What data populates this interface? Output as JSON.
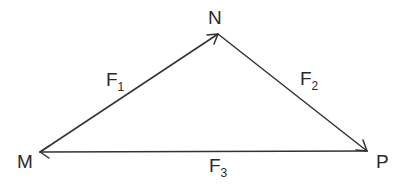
{
  "diagram": {
    "type": "vector-triangle",
    "stroke_color": "#333333",
    "points": [
      {
        "id": "M",
        "label": "M",
        "x": 40,
        "y": 152
      },
      {
        "id": "N",
        "label": "N",
        "x": 218,
        "y": 34
      },
      {
        "id": "P",
        "label": "P",
        "x": 367,
        "y": 151
      }
    ],
    "vectors": [
      {
        "id": "F1",
        "base": "F",
        "sub": "1",
        "from": "M",
        "to": "N"
      },
      {
        "id": "F2",
        "base": "F",
        "sub": "2",
        "from": "N",
        "to": "P"
      },
      {
        "id": "F3",
        "base": "F",
        "sub": "3",
        "from": "P",
        "to": "M"
      }
    ]
  },
  "labels": {
    "M": "M",
    "N": "N",
    "P": "P",
    "F1": {
      "base": "F",
      "sub": "1"
    },
    "F2": {
      "base": "F",
      "sub": "2"
    },
    "F3": {
      "base": "F",
      "sub": "3"
    }
  }
}
